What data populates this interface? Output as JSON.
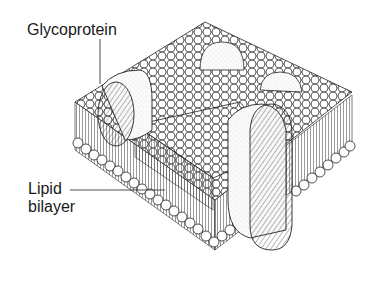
{
  "figure": {
    "labels": {
      "glycoprotein": "Glycoprotein",
      "lipid_line1": "Lipid",
      "lipid_line2": "bilayer"
    },
    "colors": {
      "stroke": "#1a1a1a",
      "fill": "#ffffff",
      "protein_stipple": "#f2f2f2"
    }
  }
}
